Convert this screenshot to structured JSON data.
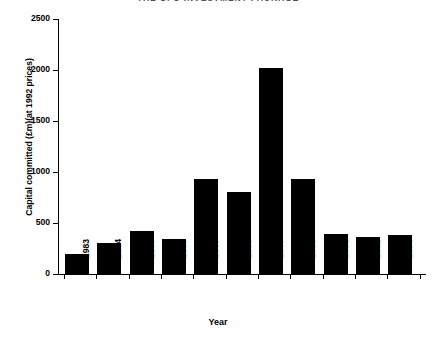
{
  "chart_data": {
    "type": "bar",
    "title": "THE UFO INVESTMENT PACKAGE",
    "xlabel": "Year",
    "ylabel": "Capital committed (£m)(at 1992 prices)",
    "categories": [
      "1983",
      "1984",
      "1985",
      "1986",
      "1987",
      "1988",
      "1989",
      "1990",
      "1991",
      "1992",
      "1993"
    ],
    "values": [
      200,
      300,
      420,
      340,
      930,
      800,
      2020,
      930,
      390,
      360,
      380
    ],
    "ylim": [
      0,
      2500
    ],
    "yticks": [
      0,
      500,
      1000,
      1500,
      2000,
      2500
    ],
    "ytick_labels": [
      "0",
      "500",
      "1000",
      "1500",
      "2000",
      "2500"
    ],
    "grid": false,
    "legend": "none",
    "bar_color": "#000000",
    "series": [
      {
        "name": "Capital committed",
        "values": [
          200,
          300,
          420,
          340,
          930,
          800,
          2020,
          930,
          390,
          360,
          380
        ]
      }
    ]
  }
}
